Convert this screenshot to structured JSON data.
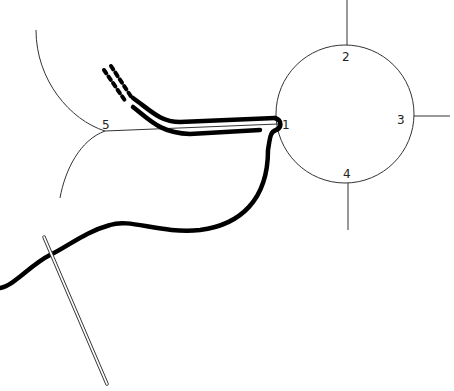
{
  "diagram": {
    "labels": [
      {
        "id": "1",
        "text": "1",
        "x": 282,
        "y": 129
      },
      {
        "id": "2",
        "text": "2",
        "x": 342,
        "y": 61
      },
      {
        "id": "3",
        "text": "3",
        "x": 397,
        "y": 124
      },
      {
        "id": "4",
        "text": "4",
        "x": 343,
        "y": 178
      },
      {
        "id": "5",
        "text": "5",
        "x": 102,
        "y": 129
      }
    ],
    "colors": {
      "line": "#222222",
      "thread": "#000000",
      "background": "#ffffff"
    }
  }
}
